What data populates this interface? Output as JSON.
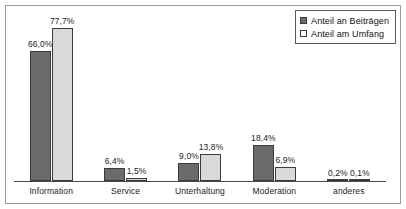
{
  "chart_data": {
    "type": "bar",
    "title": "",
    "subtitle": "",
    "xlabel": "",
    "ylabel": "",
    "ylim": [
      0,
      85
    ],
    "grid": false,
    "legend_position": "top-right",
    "value_suffix": "%",
    "decimal_separator": ",",
    "categories": [
      "Information",
      "Service",
      "Unterhaltung",
      "Moderation",
      "anderes"
    ],
    "series": [
      {
        "name": "Anteil an Beiträgen",
        "color": "#6b6b6b",
        "values": [
          66.0,
          6.4,
          9.0,
          18.4,
          0.2
        ],
        "labels": [
          "66,0%",
          "6,4%",
          "9,0%",
          "18,4%",
          "0,2%"
        ]
      },
      {
        "name": "Anteil am Umfang",
        "color": "#d9d9d9",
        "values": [
          77.7,
          1.5,
          13.8,
          6.9,
          0.1
        ],
        "labels": [
          "77,7%",
          "1,5%",
          "13,8%",
          "6,9%",
          "0,1%"
        ]
      }
    ]
  },
  "legend": {
    "items": [
      {
        "label": "Anteil an Beiträgen",
        "swatch": "dark-gray-swatch"
      },
      {
        "label": "Anteil am Umfang",
        "swatch": "light-gray-swatch"
      }
    ]
  },
  "axis": {
    "categories": [
      "Information",
      "Service",
      "Unterhaltung",
      "Moderation",
      "anderes"
    ]
  }
}
